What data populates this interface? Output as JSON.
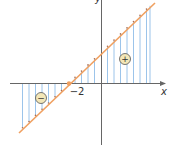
{
  "diagram": {
    "type": "linear-function-sign-chart",
    "axes": {
      "x_label": "x",
      "y_label": "y"
    },
    "root": {
      "value": -2,
      "label": "−2"
    },
    "regions": [
      {
        "sign": "negative",
        "symbol": "−",
        "side": "left of root"
      },
      {
        "sign": "positive",
        "symbol": "+",
        "side": "right of root"
      }
    ],
    "colors": {
      "line": "#f0a060",
      "hatch": "#9cc4ea",
      "axis": "#555555"
    }
  }
}
